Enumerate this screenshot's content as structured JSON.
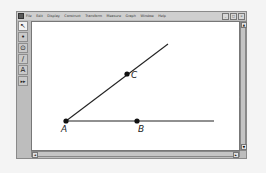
{
  "window": {
    "menu": [
      "File",
      "Edit",
      "Display",
      "Construct",
      "Transform",
      "Measure",
      "Graph",
      "Window",
      "Help"
    ],
    "controls": [
      "_",
      "□",
      "×"
    ]
  },
  "toolbox": [
    {
      "name": "arrow-tool",
      "glyph": "↖",
      "active": true
    },
    {
      "name": "point-tool",
      "glyph": "•",
      "active": false
    },
    {
      "name": "compass-tool",
      "glyph": "⊙",
      "active": false
    },
    {
      "name": "straightedge-tool",
      "glyph": "∕",
      "active": false
    },
    {
      "name": "text-tool",
      "glyph": "A",
      "active": false
    },
    {
      "name": "custom-tool",
      "glyph": "▸▸",
      "active": false
    }
  ],
  "sketch": {
    "points": [
      {
        "label": "A",
        "x": 66,
        "y": 121
      },
      {
        "label": "B",
        "x": 137,
        "y": 121
      },
      {
        "label": "C",
        "x": 127,
        "y": 74
      }
    ],
    "ray_AC_end": {
      "x": 168,
      "y": 44
    },
    "ray_AB_end": {
      "x": 214,
      "y": 121
    },
    "stray_dot": {
      "x": 240,
      "y": 97
    }
  },
  "scroll": {
    "up": "▲",
    "down": "▼",
    "left": "◄",
    "right": "►"
  }
}
